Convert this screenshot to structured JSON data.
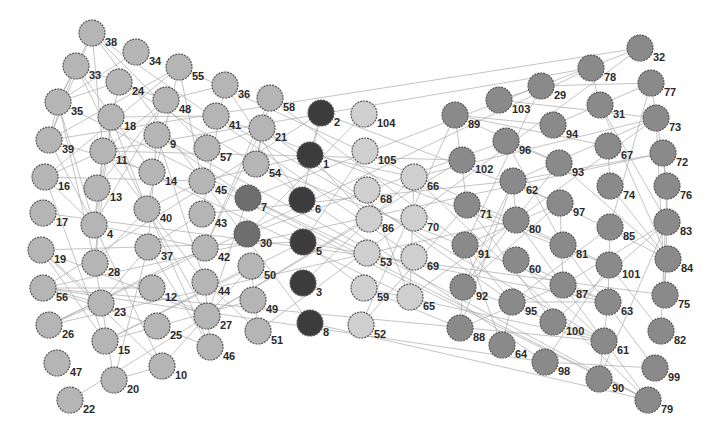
{
  "diagram": {
    "type": "network-graph",
    "groups": {
      "left": {
        "color": "#b5b5b5"
      },
      "core": {
        "color": "#3c3c3c"
      },
      "core2": {
        "color": "#6e6e6e"
      },
      "bridge": {
        "color": "#cfcfcf"
      },
      "right": {
        "color": "#8a8a8a"
      }
    },
    "nodes": [
      {
        "id": "38",
        "x": 92,
        "y": 33,
        "g": "left"
      },
      {
        "id": "34",
        "x": 136,
        "y": 52,
        "g": "left"
      },
      {
        "id": "33",
        "x": 76,
        "y": 66,
        "g": "left"
      },
      {
        "id": "55",
        "x": 179,
        "y": 67,
        "g": "left"
      },
      {
        "id": "24",
        "x": 119,
        "y": 82,
        "g": "left"
      },
      {
        "id": "48",
        "x": 166,
        "y": 100,
        "g": "left"
      },
      {
        "id": "36",
        "x": 225,
        "y": 85,
        "g": "left"
      },
      {
        "id": "58",
        "x": 270,
        "y": 98,
        "g": "left"
      },
      {
        "id": "35",
        "x": 58,
        "y": 102,
        "g": "left"
      },
      {
        "id": "18",
        "x": 111,
        "y": 117,
        "g": "left"
      },
      {
        "id": "41",
        "x": 216,
        "y": 116,
        "g": "left"
      },
      {
        "id": "21",
        "x": 262,
        "y": 128,
        "g": "left"
      },
      {
        "id": "39",
        "x": 49,
        "y": 140,
        "g": "left"
      },
      {
        "id": "9",
        "x": 157,
        "y": 135,
        "g": "left"
      },
      {
        "id": "11",
        "x": 103,
        "y": 151,
        "g": "left"
      },
      {
        "id": "57",
        "x": 207,
        "y": 148,
        "g": "left"
      },
      {
        "id": "54",
        "x": 256,
        "y": 164,
        "g": "left"
      },
      {
        "id": "16",
        "x": 45,
        "y": 177,
        "g": "left"
      },
      {
        "id": "14",
        "x": 152,
        "y": 172,
        "g": "left"
      },
      {
        "id": "45",
        "x": 202,
        "y": 181,
        "g": "left"
      },
      {
        "id": "13",
        "x": 97,
        "y": 188,
        "g": "left"
      },
      {
        "id": "17",
        "x": 43,
        "y": 213,
        "g": "left"
      },
      {
        "id": "40",
        "x": 147,
        "y": 209,
        "g": "left"
      },
      {
        "id": "43",
        "x": 202,
        "y": 214,
        "g": "left"
      },
      {
        "id": "4",
        "x": 94,
        "y": 225,
        "g": "left"
      },
      {
        "id": "19",
        "x": 41,
        "y": 250,
        "g": "left"
      },
      {
        "id": "37",
        "x": 148,
        "y": 247,
        "g": "left"
      },
      {
        "id": "42",
        "x": 205,
        "y": 248,
        "g": "left"
      },
      {
        "id": "28",
        "x": 95,
        "y": 263,
        "g": "left"
      },
      {
        "id": "56",
        "x": 43,
        "y": 288,
        "g": "left"
      },
      {
        "id": "12",
        "x": 152,
        "y": 288,
        "g": "left"
      },
      {
        "id": "44",
        "x": 205,
        "y": 282,
        "g": "left"
      },
      {
        "id": "50",
        "x": 251,
        "y": 266,
        "g": "left"
      },
      {
        "id": "23",
        "x": 101,
        "y": 303,
        "g": "left"
      },
      {
        "id": "49",
        "x": 253,
        "y": 300,
        "g": "left"
      },
      {
        "id": "27",
        "x": 207,
        "y": 316,
        "g": "left"
      },
      {
        "id": "26",
        "x": 49,
        "y": 325,
        "g": "left"
      },
      {
        "id": "25",
        "x": 157,
        "y": 326,
        "g": "left"
      },
      {
        "id": "51",
        "x": 258,
        "y": 331,
        "g": "left"
      },
      {
        "id": "15",
        "x": 105,
        "y": 341,
        "g": "left"
      },
      {
        "id": "46",
        "x": 210,
        "y": 347,
        "g": "left"
      },
      {
        "id": "47",
        "x": 57,
        "y": 363,
        "g": "left"
      },
      {
        "id": "10",
        "x": 162,
        "y": 366,
        "g": "left"
      },
      {
        "id": "20",
        "x": 114,
        "y": 380,
        "g": "left"
      },
      {
        "id": "22",
        "x": 70,
        "y": 400,
        "g": "left"
      },
      {
        "id": "2",
        "x": 321,
        "y": 113,
        "g": "core"
      },
      {
        "id": "1",
        "x": 310,
        "y": 155,
        "g": "core"
      },
      {
        "id": "6",
        "x": 302,
        "y": 200,
        "g": "core"
      },
      {
        "id": "5",
        "x": 303,
        "y": 242,
        "g": "core"
      },
      {
        "id": "3",
        "x": 303,
        "y": 283,
        "g": "core"
      },
      {
        "id": "8",
        "x": 310,
        "y": 323,
        "g": "core"
      },
      {
        "id": "7",
        "x": 248,
        "y": 198,
        "g": "core2"
      },
      {
        "id": "30",
        "x": 247,
        "y": 234,
        "g": "core2"
      },
      {
        "id": "104",
        "x": 364,
        "y": 114,
        "g": "bridge"
      },
      {
        "id": "105",
        "x": 365,
        "y": 151,
        "g": "bridge"
      },
      {
        "id": "68",
        "x": 367,
        "y": 190,
        "g": "bridge"
      },
      {
        "id": "66",
        "x": 414,
        "y": 177,
        "g": "bridge"
      },
      {
        "id": "86",
        "x": 369,
        "y": 219,
        "g": "bridge"
      },
      {
        "id": "70",
        "x": 414,
        "y": 218,
        "g": "bridge"
      },
      {
        "id": "53",
        "x": 367,
        "y": 253,
        "g": "bridge"
      },
      {
        "id": "69",
        "x": 414,
        "y": 257,
        "g": "bridge"
      },
      {
        "id": "59",
        "x": 364,
        "y": 288,
        "g": "bridge"
      },
      {
        "id": "65",
        "x": 410,
        "y": 297,
        "g": "bridge"
      },
      {
        "id": "52",
        "x": 361,
        "y": 325,
        "g": "bridge"
      },
      {
        "id": "32",
        "x": 640,
        "y": 48,
        "g": "right"
      },
      {
        "id": "78",
        "x": 591,
        "y": 68,
        "g": "right"
      },
      {
        "id": "29",
        "x": 541,
        "y": 86,
        "g": "right"
      },
      {
        "id": "77",
        "x": 651,
        "y": 83,
        "g": "right"
      },
      {
        "id": "103",
        "x": 499,
        "y": 100,
        "g": "right"
      },
      {
        "id": "31",
        "x": 600,
        "y": 105,
        "g": "right"
      },
      {
        "id": "89",
        "x": 455,
        "y": 115,
        "g": "right"
      },
      {
        "id": "73",
        "x": 656,
        "y": 118,
        "g": "right"
      },
      {
        "id": "94",
        "x": 553,
        "y": 125,
        "g": "right"
      },
      {
        "id": "96",
        "x": 506,
        "y": 141,
        "g": "right"
      },
      {
        "id": "67",
        "x": 608,
        "y": 146,
        "g": "right"
      },
      {
        "id": "72",
        "x": 663,
        "y": 153,
        "g": "right"
      },
      {
        "id": "102",
        "x": 462,
        "y": 160,
        "g": "right"
      },
      {
        "id": "93",
        "x": 559,
        "y": 163,
        "g": "right"
      },
      {
        "id": "62",
        "x": 513,
        "y": 181,
        "g": "right"
      },
      {
        "id": "74",
        "x": 610,
        "y": 186,
        "g": "right"
      },
      {
        "id": "76",
        "x": 667,
        "y": 186,
        "g": "right"
      },
      {
        "id": "71",
        "x": 467,
        "y": 205,
        "g": "right"
      },
      {
        "id": "97",
        "x": 560,
        "y": 203,
        "g": "right"
      },
      {
        "id": "80",
        "x": 516,
        "y": 220,
        "g": "right"
      },
      {
        "id": "85",
        "x": 610,
        "y": 227,
        "g": "right"
      },
      {
        "id": "83",
        "x": 667,
        "y": 222,
        "g": "right"
      },
      {
        "id": "91",
        "x": 465,
        "y": 245,
        "g": "right"
      },
      {
        "id": "81",
        "x": 563,
        "y": 245,
        "g": "right"
      },
      {
        "id": "60",
        "x": 516,
        "y": 260,
        "g": "right"
      },
      {
        "id": "101",
        "x": 609,
        "y": 265,
        "g": "right"
      },
      {
        "id": "84",
        "x": 668,
        "y": 259,
        "g": "right"
      },
      {
        "id": "92",
        "x": 463,
        "y": 287,
        "g": "right"
      },
      {
        "id": "87",
        "x": 563,
        "y": 285,
        "g": "right"
      },
      {
        "id": "95",
        "x": 512,
        "y": 302,
        "g": "right"
      },
      {
        "id": "75",
        "x": 665,
        "y": 295,
        "g": "right"
      },
      {
        "id": "63",
        "x": 608,
        "y": 302,
        "g": "right"
      },
      {
        "id": "88",
        "x": 460,
        "y": 328,
        "g": "right"
      },
      {
        "id": "100",
        "x": 553,
        "y": 322,
        "g": "right"
      },
      {
        "id": "82",
        "x": 661,
        "y": 331,
        "g": "right"
      },
      {
        "id": "64",
        "x": 502,
        "y": 345,
        "g": "right"
      },
      {
        "id": "61",
        "x": 604,
        "y": 341,
        "g": "right"
      },
      {
        "id": "98",
        "x": 545,
        "y": 362,
        "g": "right"
      },
      {
        "id": "99",
        "x": 655,
        "y": 368,
        "g": "right"
      },
      {
        "id": "90",
        "x": 599,
        "y": 379,
        "g": "right"
      },
      {
        "id": "79",
        "x": 648,
        "y": 400,
        "g": "right"
      }
    ]
  }
}
